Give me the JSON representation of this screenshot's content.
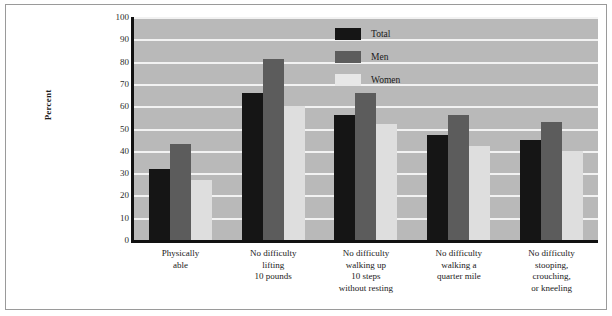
{
  "chart_data": {
    "type": "bar",
    "title": "",
    "xlabel": "",
    "ylabel": "Percent",
    "ylim": [
      0,
      100
    ],
    "yticks": [
      100,
      90,
      80,
      70,
      60,
      50,
      40,
      30,
      20,
      10,
      0
    ],
    "grid": true,
    "legend_position": "upper right",
    "categories": [
      "Physically\nable",
      "No difficulty\nlifting\n10 pounds",
      "No difficulty\nwalking up\n10 steps\nwithout resting",
      "No difficulty\nwalking a\nquarter mile",
      "No difficulty\nstooping,\ncrouching,\nor kneeling"
    ],
    "category_lines": [
      [
        "Physically",
        "able"
      ],
      [
        "No difficulty",
        "lifting",
        "10 pounds"
      ],
      [
        "No difficulty",
        "walking up",
        "10 steps",
        "without resting"
      ],
      [
        "No difficulty",
        "walking a",
        "quarter mile"
      ],
      [
        "No difficulty",
        "stooping,",
        "crouching,",
        "or kneeling"
      ]
    ],
    "series": [
      {
        "name": "Total",
        "color": "#151515",
        "values": [
          32,
          66,
          56,
          47,
          45
        ]
      },
      {
        "name": "Men",
        "color": "#5c5c5c",
        "values": [
          43,
          81,
          66,
          56,
          53
        ]
      },
      {
        "name": "Women",
        "color": "#dedede",
        "values": [
          27,
          60,
          52,
          42,
          40
        ]
      }
    ]
  },
  "legend": {
    "items": [
      {
        "label": "Total"
      },
      {
        "label": "Men"
      },
      {
        "label": "Women"
      }
    ]
  },
  "colors": {
    "plot_background": "#b9b9b9",
    "gridline": "#f2f2f2",
    "axis": "#111111",
    "total": "#151515",
    "men": "#5c5c5c",
    "women": "#dedede"
  }
}
